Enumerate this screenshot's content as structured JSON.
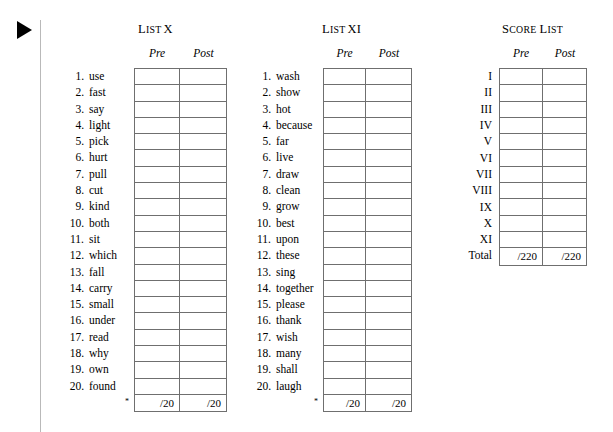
{
  "marker": {
    "icon": "play-triangle-icon"
  },
  "lists": [
    {
      "id": "list-x",
      "title_cap": "L",
      "title_sc": "IST",
      "title_num": "X",
      "columns": [
        "Pre",
        "Post"
      ],
      "footnote": "*",
      "total_values": [
        "/20",
        "/20"
      ],
      "items": [
        {
          "num": "1.",
          "word": "use"
        },
        {
          "num": "2.",
          "word": "fast"
        },
        {
          "num": "3.",
          "word": "say"
        },
        {
          "num": "4.",
          "word": "light"
        },
        {
          "num": "5.",
          "word": "pick"
        },
        {
          "num": "6.",
          "word": "hurt"
        },
        {
          "num": "7.",
          "word": "pull"
        },
        {
          "num": "8.",
          "word": "cut"
        },
        {
          "num": "9.",
          "word": "kind"
        },
        {
          "num": "10.",
          "word": "both"
        },
        {
          "num": "11.",
          "word": "sit"
        },
        {
          "num": "12.",
          "word": "which"
        },
        {
          "num": "13.",
          "word": "fall"
        },
        {
          "num": "14.",
          "word": "carry"
        },
        {
          "num": "15.",
          "word": "small"
        },
        {
          "num": "16.",
          "word": "under"
        },
        {
          "num": "17.",
          "word": "read"
        },
        {
          "num": "18.",
          "word": "why"
        },
        {
          "num": "19.",
          "word": "own"
        },
        {
          "num": "20.",
          "word": "found"
        }
      ]
    },
    {
      "id": "list-xi",
      "title_cap": "L",
      "title_sc": "IST",
      "title_num": "XI",
      "columns": [
        "Pre",
        "Post"
      ],
      "footnote": "*",
      "total_values": [
        "/20",
        "/20"
      ],
      "items": [
        {
          "num": "1.",
          "word": "wash"
        },
        {
          "num": "2.",
          "word": "show"
        },
        {
          "num": "3.",
          "word": "hot"
        },
        {
          "num": "4.",
          "word": "because"
        },
        {
          "num": "5.",
          "word": "far"
        },
        {
          "num": "6.",
          "word": "live"
        },
        {
          "num": "7.",
          "word": "draw"
        },
        {
          "num": "8.",
          "word": "clean"
        },
        {
          "num": "9.",
          "word": "grow"
        },
        {
          "num": "10.",
          "word": "best"
        },
        {
          "num": "11.",
          "word": "upon"
        },
        {
          "num": "12.",
          "word": "these"
        },
        {
          "num": "13.",
          "word": "sing"
        },
        {
          "num": "14.",
          "word": "together"
        },
        {
          "num": "15.",
          "word": "please"
        },
        {
          "num": "16.",
          "word": "thank"
        },
        {
          "num": "17.",
          "word": "wish"
        },
        {
          "num": "18.",
          "word": "many"
        },
        {
          "num": "19.",
          "word": "shall"
        },
        {
          "num": "20.",
          "word": "laugh"
        }
      ]
    }
  ],
  "score_list": {
    "title_cap": "S",
    "title_sc": "CORE",
    "title_cap2": "L",
    "title_sc2": "IST",
    "columns": [
      "Pre",
      "Post"
    ],
    "rows": [
      "I",
      "II",
      "III",
      "IV",
      "V",
      "VI",
      "VII",
      "VIII",
      "IX",
      "X",
      "XI"
    ],
    "total_label": "Total",
    "total_values": [
      "/220",
      "/220"
    ]
  }
}
